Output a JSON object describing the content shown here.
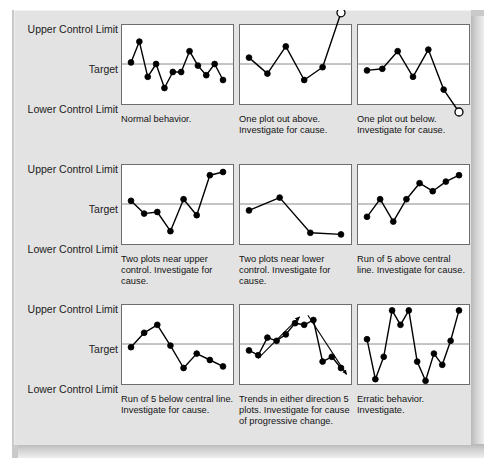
{
  "figure": {
    "axis_labels": {
      "upper": "Upper Control Limit",
      "target": "Target",
      "lower": "Lower Control Limit"
    },
    "colors": {
      "background": "#ffffff",
      "slab_face": "#e3e3e3",
      "panel_fill": "#ffffff",
      "panel_border": "#6d6d6d",
      "center_line": "#8a8a8a",
      "data_line": "#000000",
      "marker_fill": "#000000",
      "outlier_fill": "#ffffff",
      "text": "#131313"
    }
  },
  "chart_data": [
    {
      "type": "line",
      "id": "normal-behavior",
      "row": 0,
      "col": 0,
      "title": "Normal behavior.",
      "caption": "Normal behavior.",
      "ylabel": "",
      "xlabel": "",
      "ylim": [
        0,
        100
      ],
      "grid": false,
      "center_line": 50,
      "annotations": [],
      "values": [
        52,
        78,
        34,
        50,
        20,
        40,
        40,
        66,
        48,
        36,
        50,
        30
      ],
      "x": [
        1,
        2,
        3,
        4,
        5,
        6,
        7,
        8,
        9,
        10,
        11,
        12
      ],
      "outliers": []
    },
    {
      "type": "line",
      "id": "one-plot-out-above",
      "row": 0,
      "col": 1,
      "title": "One plot out above.",
      "caption": "One plot out above. Investigate for cause.",
      "caption_lines": [
        "One plot out above.",
        "Investigate for cause."
      ],
      "ylabel": "",
      "xlabel": "",
      "ylim": [
        0,
        100
      ],
      "grid": false,
      "center_line": 50,
      "annotations": [],
      "values": [
        58,
        38,
        72,
        30,
        46,
        114
      ],
      "x": [
        1,
        2,
        3,
        4,
        5,
        6
      ],
      "outliers": [
        5
      ]
    },
    {
      "type": "line",
      "id": "one-plot-out-below",
      "row": 0,
      "col": 2,
      "title": "One plot out below.",
      "caption": "One plot out below. Investigate for cause.",
      "caption_lines": [
        "One plot out below.",
        "Investigate for cause."
      ],
      "ylabel": "",
      "xlabel": "",
      "ylim": [
        0,
        100
      ],
      "grid": false,
      "center_line": 50,
      "annotations": [],
      "values": [
        42,
        44,
        66,
        34,
        68,
        18,
        -10
      ],
      "x": [
        1,
        2,
        3,
        4,
        5,
        6,
        7
      ],
      "outliers": [
        6
      ]
    },
    {
      "type": "line",
      "id": "two-plots-near-upper",
      "row": 1,
      "col": 0,
      "title": "Two plots near upper control.",
      "caption": "Two plots near upper control. Investigate for cause.",
      "caption_lines": [
        "Two plots near upper",
        "control. Investigate for",
        "cause."
      ],
      "ylabel": "",
      "xlabel": "",
      "ylim": [
        0,
        100
      ],
      "grid": false,
      "center_line": 50,
      "annotations": [],
      "values": [
        54,
        38,
        40,
        16,
        56,
        36,
        86,
        90
      ],
      "x": [
        1,
        2,
        3,
        4,
        5,
        6,
        7,
        8
      ],
      "outliers": []
    },
    {
      "type": "line",
      "id": "two-plots-near-lower",
      "row": 1,
      "col": 1,
      "title": "Two plots near lower control.",
      "caption": "Two plots near lower control. Investigate for cause.",
      "caption_lines": [
        "Two plots near lower",
        "control. Investigate for",
        "cause."
      ],
      "ylabel": "",
      "xlabel": "",
      "ylim": [
        0,
        100
      ],
      "grid": false,
      "center_line": 50,
      "annotations": [],
      "values": [
        42,
        58,
        14,
        12
      ],
      "x": [
        1,
        2,
        3,
        4
      ],
      "outliers": []
    },
    {
      "type": "line",
      "id": "run-of-5-above",
      "row": 1,
      "col": 2,
      "title": "Run of 5 above central line.",
      "caption": "Run of 5 above central line. Investigate for cause.",
      "caption_lines": [
        "Run of 5 above central",
        "line. Investigate for cause."
      ],
      "ylabel": "",
      "xlabel": "",
      "ylim": [
        0,
        100
      ],
      "grid": false,
      "center_line": 50,
      "annotations": [],
      "values": [
        34,
        56,
        28,
        56,
        76,
        66,
        78,
        86
      ],
      "x": [
        1,
        2,
        3,
        4,
        5,
        6,
        7,
        8
      ],
      "outliers": []
    },
    {
      "type": "line",
      "id": "run-of-5-below",
      "row": 2,
      "col": 0,
      "title": "Run of 5 below central line.",
      "caption": "Run of 5 below central line. Investigate for cause.",
      "caption_lines": [
        "Run of 5 below central line.",
        "Investigate for cause."
      ],
      "ylabel": "",
      "xlabel": "",
      "ylim": [
        0,
        100
      ],
      "grid": false,
      "center_line": 50,
      "annotations": [],
      "values": [
        46,
        64,
        74,
        48,
        20,
        38,
        30,
        22
      ],
      "x": [
        1,
        2,
        3,
        4,
        5,
        6,
        7,
        8
      ],
      "outliers": []
    },
    {
      "type": "line",
      "id": "trends-either-direction",
      "row": 2,
      "col": 1,
      "title": "Trends in either direction 5 plots.",
      "caption": "Trends in either direction 5 plots. Investigate for cause of progressive change.",
      "caption_lines": [
        "Trends in either direction 5",
        "plots. Investigate for cause",
        "of progressive change."
      ],
      "ylabel": "",
      "xlabel": "",
      "ylim": [
        0,
        100
      ],
      "grid": false,
      "center_line": 50,
      "annotations": [
        "up-trend-arrow",
        "down-trend-arrow"
      ],
      "values": [
        42,
        36,
        58,
        54,
        62,
        76,
        74,
        80,
        28,
        34,
        20
      ],
      "x": [
        1,
        2,
        3,
        4,
        5,
        6,
        7,
        8,
        9,
        10,
        11
      ],
      "outliers": []
    },
    {
      "type": "line",
      "id": "erratic-behavior",
      "row": 2,
      "col": 2,
      "title": "Erratic behavior.",
      "caption": "Erratic behavior. Investigate.",
      "caption_lines": [
        "Erratic behavior.",
        "Investigate."
      ],
      "ylabel": "",
      "xlabel": "",
      "ylim": [
        0,
        100
      ],
      "grid": false,
      "center_line": 50,
      "annotations": [],
      "values": [
        56,
        6,
        34,
        92,
        74,
        92,
        28,
        4,
        38,
        24,
        54,
        92
      ],
      "x": [
        1,
        2,
        3,
        4,
        5,
        6,
        7,
        8,
        9,
        10,
        11,
        12
      ],
      "outliers": []
    }
  ]
}
